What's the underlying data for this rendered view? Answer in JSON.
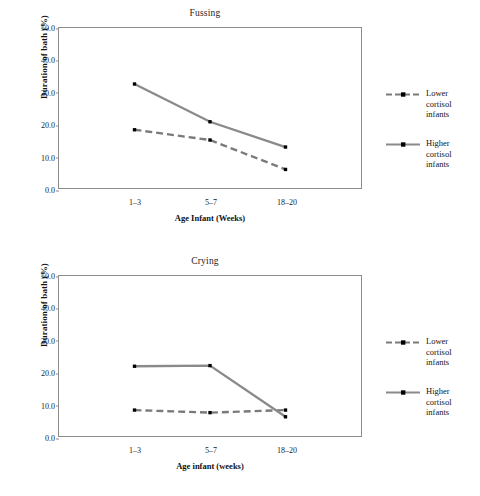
{
  "figure": {
    "panels": [
      {
        "id": "fussing",
        "title": "Fussing",
        "xlabel": "Age Infant (Weeks)",
        "ylabel": "Duration of bath (%)"
      },
      {
        "id": "crying",
        "title": "Crying",
        "xlabel": "Age infant (weeks)",
        "ylabel": "Duration of bath (%)"
      }
    ],
    "legend": {
      "lower_label": "Lower\ncortisol\ninfants",
      "higher_label": "Higher\ncortisol\ninfants"
    }
  },
  "chart_data": [
    {
      "type": "line",
      "title": "Fussing",
      "xlabel": "Age Infant (Weeks)",
      "ylabel": "Duration of bath (%)",
      "categories": [
        "1–3",
        "5–7",
        "18–20"
      ],
      "ytick_labels": [
        "0.0",
        "10.0",
        "20.0",
        "30.0",
        "40.0",
        "50.0"
      ],
      "ytick_values": [
        0,
        10,
        20,
        30,
        40,
        50
      ],
      "ylim": [
        0,
        50
      ],
      "grid": false,
      "legend_position": "right",
      "series": [
        {
          "name": "Lower cortisol infants",
          "values": [
            18.2,
            15.0,
            5.8
          ],
          "style": "dashed",
          "color": "#7a7a7a",
          "marker": "square",
          "marker_color": "#000000"
        },
        {
          "name": "Higher cortisol infants",
          "values": [
            32.5,
            20.7,
            12.8
          ],
          "style": "solid",
          "color": "#8a8a8a",
          "marker": "square",
          "marker_color": "#000000"
        }
      ]
    },
    {
      "type": "line",
      "title": "Crying",
      "xlabel": "Age infant (weeks)",
      "ylabel": "Duration of bath (%)",
      "categories": [
        "1–3",
        "5–7",
        "18–20"
      ],
      "ytick_labels": [
        "0.0",
        "10.0",
        "20.0",
        "30.0",
        "40.0",
        "50.0"
      ],
      "ytick_values": [
        0,
        10,
        20,
        30,
        40,
        50
      ],
      "ylim": [
        0,
        50
      ],
      "grid": false,
      "legend_position": "right",
      "series": [
        {
          "name": "Lower cortisol infants",
          "values": [
            8.1,
            7.3,
            8.1
          ],
          "style": "dashed",
          "color": "#7a7a7a",
          "marker": "square",
          "marker_color": "#000000"
        },
        {
          "name": "Higher cortisol infants",
          "values": [
            21.8,
            22.0,
            6.0
          ],
          "style": "solid",
          "color": "#8a8a8a",
          "marker": "square",
          "marker_color": "#000000"
        }
      ]
    }
  ]
}
